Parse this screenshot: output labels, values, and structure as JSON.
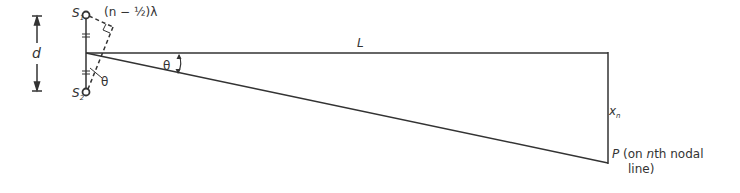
{
  "diagram": {
    "colors": {
      "line": "#333333",
      "background": "#ffffff"
    },
    "labels": {
      "d": "d",
      "s1_letter": "S",
      "s1_sub": "1",
      "s2_letter": "S",
      "s2_sub": "2",
      "path_diff": "(n − ½)λ",
      "theta_small": "θ",
      "theta_large": "θ",
      "L": "L",
      "xn_letter": "x",
      "xn_sub": "n",
      "P_letter": "P",
      "P_desc_line1": " (on ",
      "P_desc_n": "n",
      "P_desc_line1_end": "th nodal",
      "P_desc_line2": "line)"
    },
    "geometry": {
      "S1": [
        86,
        15
      ],
      "S2": [
        86,
        92
      ],
      "midpoint": [
        86,
        53
      ],
      "screen_top": [
        608,
        53
      ],
      "P": [
        608,
        163
      ]
    }
  }
}
